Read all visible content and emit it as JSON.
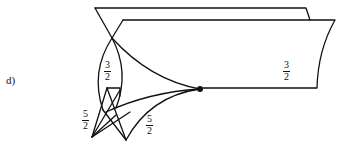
{
  "figure": {
    "label": "d)",
    "fractions": [
      {
        "id": "loop",
        "num": "3",
        "den": "2"
      },
      {
        "id": "sheet",
        "num": "3",
        "den": "2"
      },
      {
        "id": "left-cusp",
        "num": "5",
        "den": "2"
      },
      {
        "id": "right-cusp",
        "num": "5",
        "den": "2"
      }
    ],
    "colors": {
      "ink": "#111111",
      "background": "#ffffff"
    }
  }
}
